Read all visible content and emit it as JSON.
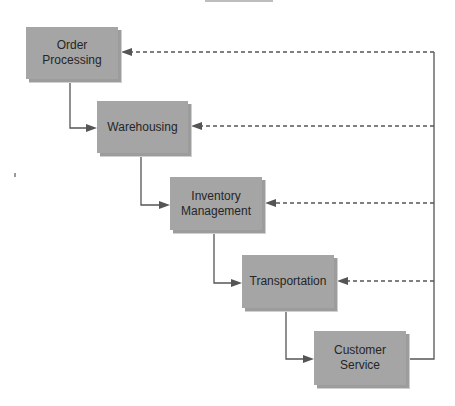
{
  "diagram": {
    "type": "logistics-process-flow",
    "colors": {
      "box_fill": "#a5a5a5",
      "box_shadow": "#9c9c9c",
      "line": "#555555",
      "text": "#262626"
    },
    "boxes": [
      {
        "id": "order-processing",
        "label": "Order\nProcessing",
        "x": 26,
        "y": 27,
        "w": 92,
        "h": 52
      },
      {
        "id": "warehousing",
        "label": "Warehousing",
        "x": 97,
        "y": 101,
        "w": 91,
        "h": 52
      },
      {
        "id": "inventory-management",
        "label": "Inventory\nManagement",
        "x": 170,
        "y": 177,
        "w": 92,
        "h": 53
      },
      {
        "id": "transportation",
        "label": "Transportation",
        "x": 242,
        "y": 255,
        "w": 92,
        "h": 53
      },
      {
        "id": "customer-service",
        "label": "Customer\nService",
        "x": 314,
        "y": 331,
        "w": 92,
        "h": 54
      }
    ],
    "forward_flow": [
      {
        "from": "order-processing",
        "to": "warehousing"
      },
      {
        "from": "warehousing",
        "to": "inventory-management"
      },
      {
        "from": "inventory-management",
        "to": "transportation"
      },
      {
        "from": "transportation",
        "to": "customer-service"
      }
    ],
    "feedback": {
      "source": "customer-service",
      "targets": [
        "order-processing",
        "warehousing",
        "inventory-management",
        "transportation"
      ],
      "return_x": 434,
      "style": "dashed"
    }
  }
}
